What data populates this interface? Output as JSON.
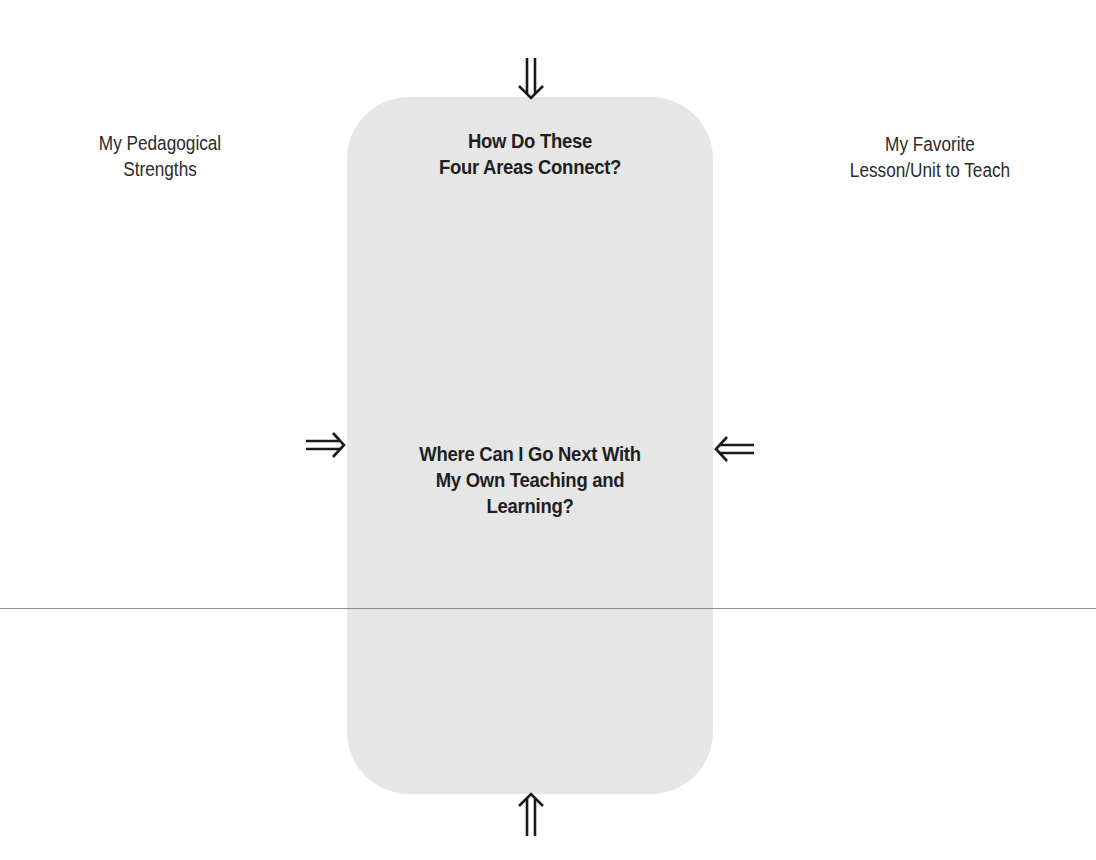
{
  "diagram": {
    "center_box": {
      "heading_top": [
        "How Do These",
        "Four Areas Connect?"
      ],
      "heading_middle": [
        "Where Can I Go Next With",
        "My Own Teaching and",
        "Learning?"
      ],
      "fill_color": "#e6e6e6"
    },
    "labels": {
      "left": [
        "My Pedagogical",
        "Strengths"
      ],
      "right": [
        "My Favorite",
        "Lesson/Unit to Teach"
      ]
    },
    "arrows": [
      {
        "position": "top",
        "icon": "double-arrow-down-icon"
      },
      {
        "position": "bottom",
        "icon": "double-arrow-up-icon"
      },
      {
        "position": "left",
        "icon": "double-arrow-right-icon"
      },
      {
        "position": "right",
        "icon": "double-arrow-left-icon"
      }
    ],
    "divider_color": "#8f8f8f"
  }
}
